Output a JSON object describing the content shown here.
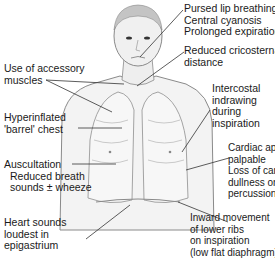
{
  "diagram": {
    "labels": {
      "face": [
        "Pursed lip breathing",
        "Central cyanosis",
        "Prolonged expiration"
      ],
      "cricosternal": [
        "Reduced cricosternal",
        "distance"
      ],
      "accessory": [
        "Use of accessory",
        "muscles"
      ],
      "intercostal": [
        "Intercostal",
        "indrawing",
        "during",
        "inspiration"
      ],
      "barrel": [
        "Hyperinflated",
        "'barrel' chest"
      ],
      "auscultation": [
        "Auscultation",
        "Reduced breath",
        "sounds ± wheeze"
      ],
      "cardiac": [
        "Cardiac apex not",
        "palpable",
        "Loss of cardiac",
        "dullness on",
        "percussion"
      ],
      "heart": [
        "Heart sounds",
        "loudest in",
        "epigastrium"
      ],
      "ribs": [
        "Inward movement",
        "of lower ribs",
        "on inspiration",
        "(low flat diaphragm)"
      ]
    },
    "colors": {
      "line": "#333333",
      "skin": "#f2f2f2",
      "outline": "#8a8a8a",
      "text": "#1a1a1a"
    }
  }
}
